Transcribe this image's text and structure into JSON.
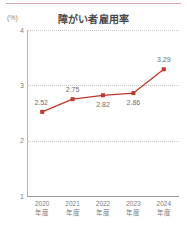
{
  "chart_data": {
    "type": "line",
    "title": "障がい者雇用率",
    "unit_label": "(%)",
    "xlabel": "",
    "ylabel": "",
    "categories": [
      "2020\n年度",
      "2021\n年度",
      "2022\n年度",
      "2023\n年度",
      "2024\n年度"
    ],
    "values": [
      2.52,
      2.75,
      2.82,
      2.86,
      3.29
    ],
    "point_labels": [
      "2.52",
      "2.75",
      "2.82",
      "2.86",
      "3.29"
    ],
    "yticks": [
      "4",
      "3",
      "2",
      "1"
    ],
    "ytick_values": [
      4,
      3,
      2,
      1
    ],
    "ylim": [
      1,
      4
    ],
    "grid": true,
    "gridlines_at": [
      4,
      3,
      2
    ],
    "legend": "none",
    "series_color": "#c0392b",
    "marker": "square",
    "label_positions": [
      "below-left",
      "above",
      "below",
      "below",
      "above"
    ]
  },
  "colors": {
    "top_rule": "#d9a8ad",
    "title": "#4a4a4a",
    "axis": "#b4b4b4",
    "grid": "#c8c8c8",
    "tick_text": "#7d7d7d",
    "data_label": "#6d6d6d",
    "series": "#c0392b"
  }
}
